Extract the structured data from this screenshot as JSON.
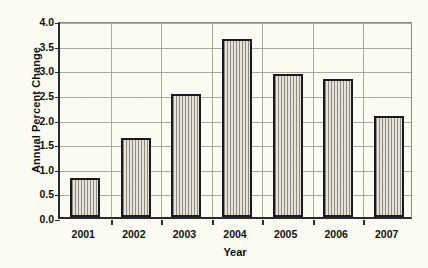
{
  "chart_data": {
    "type": "bar",
    "title": "",
    "xlabel": "Year",
    "ylabel": "Annual Percent Change",
    "categories": [
      "2001",
      "2002",
      "2003",
      "2004",
      "2005",
      "2006",
      "2007"
    ],
    "values": [
      0.8,
      1.6,
      2.5,
      3.62,
      2.9,
      2.8,
      2.05
    ],
    "ylim": [
      0.0,
      4.0
    ],
    "ytick_labels": [
      "0.0",
      "0.5",
      "1.0",
      "1.5",
      "2.0",
      "2.5",
      "3.0",
      "3.5",
      "4.0"
    ],
    "ytick_values": [
      0.0,
      0.5,
      1.0,
      1.5,
      2.0,
      2.5,
      3.0,
      3.5,
      4.0
    ],
    "grid": true,
    "grid_axis": "both",
    "legend": null,
    "legend_position": "none",
    "series": [
      {
        "name": "Annual Percent Change",
        "values": [
          0.8,
          1.6,
          2.5,
          3.62,
          2.9,
          2.8,
          2.05
        ]
      }
    ],
    "bar_fill_color": "#d5d2c8",
    "bar_edge_color": "#1a1a1a",
    "bar_pattern": "vertical-hatch",
    "background_color": "#fbfaf3",
    "axis_color": "#2a2a2a",
    "grid_color": "#a9a9a2"
  }
}
